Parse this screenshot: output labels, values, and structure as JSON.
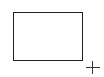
{
  "canvas": {
    "background": "#ffffff",
    "shape": {
      "type": "rectangle",
      "x": 13,
      "y": 12,
      "width": 70,
      "height": 49,
      "stroke": "#222222",
      "fill": "#ffffff"
    },
    "cursor": {
      "type": "crosshair-icon",
      "x": 86,
      "y": 61,
      "color": "#333333"
    }
  }
}
